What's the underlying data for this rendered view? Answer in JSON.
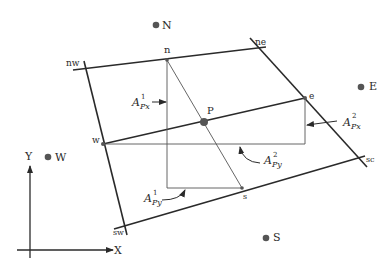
{
  "diagram": {
    "colors": {
      "line": "#2a2a2a",
      "thin_line": "#555555",
      "node": "#555555",
      "background": "#ffffff"
    },
    "nodes": {
      "N": "N",
      "E": "E",
      "W": "W",
      "S": "S",
      "P": "P"
    },
    "face_points": {
      "n": "n",
      "e": "e",
      "w": "w",
      "s": "s"
    },
    "corners": {
      "nw": "nw",
      "ne": "ne",
      "sw": "sw",
      "se": "sc"
    },
    "axes": {
      "x": "X",
      "y": "Y"
    },
    "areas": {
      "A1px": {
        "base": "A",
        "sup": "1",
        "sub": "Px"
      },
      "A2px": {
        "base": "A",
        "sup": "2",
        "sub": "Px"
      },
      "A1py": {
        "base": "A",
        "sup": "1",
        "sub": "Py"
      },
      "A2py": {
        "base": "A",
        "sup": "2",
        "sub": "Py"
      }
    }
  }
}
